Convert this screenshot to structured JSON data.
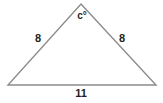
{
  "figure": {
    "name": "isosceles-triangle",
    "background_color": "#ffffff",
    "stroke_color": "#8c8c8c",
    "label_color": "#231f20"
  },
  "geometry": {
    "vertices": {
      "apex": {
        "x": 81,
        "y": 4
      },
      "bottom_left": {
        "x": 8,
        "y": 85
      },
      "bottom_right": {
        "x": 156,
        "y": 85
      }
    }
  },
  "labels": {
    "left_side": {
      "text": "8",
      "x": 38,
      "y": 38
    },
    "right_side": {
      "text": "8",
      "x": 122,
      "y": 38
    },
    "base": {
      "text": "11",
      "x": 81,
      "y": 93
    },
    "apex_angle": {
      "text": "c°",
      "x": 82,
      "y": 16
    }
  }
}
